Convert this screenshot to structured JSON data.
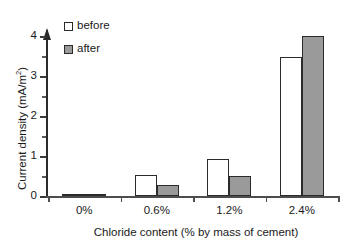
{
  "chart_data": {
    "type": "bar",
    "title": "",
    "xlabel": "Chloride content (% by mass of cement)",
    "ylabel": "Current density (mA/m²)",
    "ylabel_main": "Current density (mA/m",
    "ylabel_sup": "2",
    "ylabel_tail": ")",
    "categories": [
      "0%",
      "0.6%",
      "1.2%",
      "2.4%"
    ],
    "series": [
      {
        "name": "before",
        "values": [
          0.06,
          0.52,
          0.93,
          3.47
        ],
        "color": "#ffffff"
      },
      {
        "name": "after",
        "values": [
          0.05,
          0.27,
          0.51,
          4.0
        ],
        "color": "#9a9a9a"
      }
    ],
    "ylim": [
      0,
      4.35
    ],
    "yticks": [
      0,
      1,
      2,
      3,
      4
    ],
    "ytick_labels": [
      "0",
      "1",
      "2",
      "3",
      "4"
    ],
    "yminor_ticks": [
      0.5,
      1.5,
      2.5,
      3.5
    ],
    "grid": false,
    "legend_position": "upper-left-inside",
    "axis_color": "#2b2b2b",
    "bar_edge_color": "#2b2b2b"
  },
  "legend": {
    "items": [
      {
        "label": "before",
        "swatch": "open-square"
      },
      {
        "label": "after",
        "swatch": "filled-square"
      }
    ]
  }
}
